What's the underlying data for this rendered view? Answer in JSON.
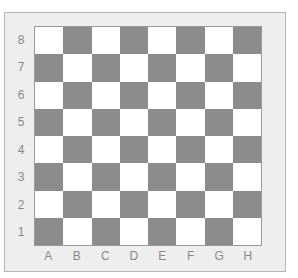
{
  "board": {
    "colors": {
      "light": "#ffffff",
      "dark": "#8c8c8c",
      "frame": "#eeeeee",
      "label": "#8a8a8a"
    },
    "ranks": [
      "8",
      "7",
      "6",
      "5",
      "4",
      "3",
      "2",
      "1"
    ],
    "files": [
      "A",
      "B",
      "C",
      "D",
      "E",
      "F",
      "G",
      "H"
    ],
    "top_left_square": "light"
  }
}
